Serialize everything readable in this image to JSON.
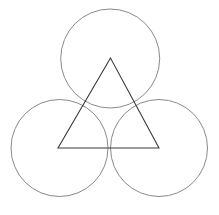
{
  "canvas": {
    "width": 219,
    "height": 215,
    "background": "#ffffff"
  },
  "circles": [
    {
      "name": "top-circle",
      "cx": 110.2,
      "cy": 58.5,
      "r": 49.5,
      "stroke": "#8a8a8a",
      "stroke_width": 1
    },
    {
      "name": "bottom-left-circle",
      "cx": 59.5,
      "cy": 148,
      "r": 48.5,
      "stroke": "#8a8a8a",
      "stroke_width": 1
    },
    {
      "name": "bottom-right-circle",
      "cx": 159,
      "cy": 148,
      "r": 48.5,
      "stroke": "#8a8a8a",
      "stroke_width": 1
    }
  ],
  "triangle": {
    "name": "equilateral-triangle",
    "points": [
      [
        110.5,
        58
      ],
      [
        58,
        148
      ],
      [
        159,
        148
      ]
    ],
    "stroke": "#3a3a3a",
    "stroke_width": 1.1
  }
}
